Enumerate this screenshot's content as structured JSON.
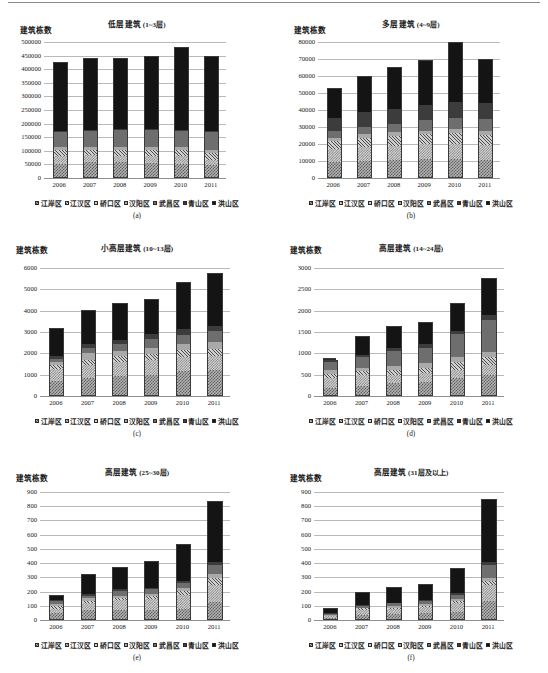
{
  "figure": {
    "y_axis_title": "建筑栋数",
    "districts": [
      "江岸区",
      "江汉区",
      "硚口区",
      "汉阳区",
      "武昌区",
      "青山区",
      "洪山区"
    ],
    "years": [
      "2006",
      "2007",
      "2008",
      "2009",
      "2010",
      "2011"
    ]
  },
  "chart_data": [
    {
      "type": "bar",
      "panel": "a",
      "caption": "(a)",
      "title": "低层建筑",
      "title_range": "(1~3层)",
      "ylabel": "建筑栋数",
      "xlabel": "",
      "ylim": [
        0,
        500000
      ],
      "yticks": [
        0,
        50000,
        100000,
        150000,
        200000,
        250000,
        300000,
        350000,
        400000,
        450000,
        500000
      ],
      "grid": true,
      "legend_position": "bottom",
      "stacked": true,
      "categories": [
        "2006",
        "2007",
        "2008",
        "2009",
        "2010",
        "2011"
      ],
      "series": [
        {
          "name": "江岸区",
          "values": [
            47000,
            56000,
            55000,
            50000,
            48000,
            43000
          ]
        },
        {
          "name": "江汉区",
          "values": [
            29000,
            25000,
            21000,
            28000,
            28000,
            19000
          ]
        },
        {
          "name": "硚口区",
          "values": [
            23000,
            20000,
            24000,
            23000,
            23000,
            27000
          ]
        },
        {
          "name": "汉阳区",
          "values": [
            11000,
            11000,
            11000,
            11000,
            11000,
            11000
          ]
        },
        {
          "name": "武昌区",
          "values": [
            57000,
            57000,
            61000,
            62000,
            60000,
            64000
          ]
        },
        {
          "name": "青山区",
          "values": [
            4000,
            4000,
            4000,
            4000,
            4000,
            4000
          ]
        },
        {
          "name": "洪山区",
          "values": [
            249000,
            262000,
            257000,
            262000,
            301000,
            272000
          ]
        }
      ],
      "totals": [
        420000,
        435000,
        433000,
        440000,
        475000,
        440000
      ]
    },
    {
      "type": "bar",
      "panel": "b",
      "caption": "(b)",
      "title": "多层建筑",
      "title_range": "(4~9层)",
      "ylabel": "建筑栋数",
      "xlabel": "",
      "ylim": [
        0,
        80000
      ],
      "yticks": [
        0,
        10000,
        20000,
        30000,
        40000,
        50000,
        60000,
        70000,
        80000
      ],
      "grid": true,
      "legend_position": "bottom",
      "stacked": true,
      "categories": [
        "2006",
        "2007",
        "2008",
        "2009",
        "2010",
        "2011"
      ],
      "series": [
        {
          "name": "江岸区",
          "values": [
            9000,
            9500,
            10200,
            10500,
            10800,
            10300
          ]
        },
        {
          "name": "江汉区",
          "values": [
            7200,
            8000,
            7800,
            8700,
            9000,
            8300
          ]
        },
        {
          "name": "硚口区",
          "values": [
            4800,
            5700,
            6200,
            5900,
            6400,
            6000
          ]
        },
        {
          "name": "汉阳区",
          "values": [
            2200,
            2200,
            2300,
            2200,
            2400,
            2300
          ]
        },
        {
          "name": "武昌区",
          "values": [
            4000,
            4200,
            4800,
            6100,
            6800,
            7400
          ]
        },
        {
          "name": "青山区",
          "values": [
            7800,
            8400,
            8700,
            8800,
            9100,
            9200
          ]
        },
        {
          "name": "洪山区",
          "values": [
            17000,
            21000,
            24000,
            25800,
            35500,
            25500
          ]
        }
      ],
      "totals": [
        52000,
        59000,
        64000,
        68000,
        72000,
        69000
      ]
    },
    {
      "type": "bar",
      "panel": "c",
      "caption": "(c)",
      "title": "小高层建筑",
      "title_range": "(10~13层)",
      "ylabel": "建筑栋数",
      "xlabel": "",
      "ylim": [
        0,
        6000
      ],
      "yticks": [
        0,
        1000,
        2000,
        3000,
        4000,
        5000,
        6000
      ],
      "grid": true,
      "legend_position": "bottom",
      "stacked": true,
      "categories": [
        "2006",
        "2007",
        "2008",
        "2009",
        "2010",
        "2011"
      ],
      "series": [
        {
          "name": "江岸区",
          "values": [
            640,
            780,
            900,
            940,
            1120,
            1160
          ]
        },
        {
          "name": "江汉区",
          "values": [
            600,
            620,
            640,
            680,
            660,
            670
          ]
        },
        {
          "name": "硚口区",
          "values": [
            180,
            260,
            300,
            300,
            320,
            340
          ]
        },
        {
          "name": "汉阳区",
          "values": [
            110,
            290,
            220,
            280,
            290,
            310
          ]
        },
        {
          "name": "武昌区",
          "values": [
            140,
            250,
            320,
            420,
            440,
            500
          ]
        },
        {
          "name": "青山区",
          "values": [
            180,
            200,
            220,
            230,
            250,
            270
          ]
        },
        {
          "name": "洪山区",
          "values": [
            1230,
            1560,
            1660,
            1620,
            2190,
            2420
          ]
        }
      ],
      "totals": [
        3080,
        3960,
        4260,
        4470,
        5270,
        5670
      ]
    },
    {
      "type": "bar",
      "panel": "d",
      "caption": "(d)",
      "title": "高层建筑",
      "title_range": "(14~24层)",
      "ylabel": "建筑栋数",
      "xlabel": "",
      "ylim": [
        0,
        3000
      ],
      "yticks": [
        0,
        500,
        1000,
        1500,
        2000,
        2500,
        3000
      ],
      "grid": true,
      "legend_position": "bottom",
      "stacked": true,
      "categories": [
        "2006",
        "2007",
        "2008",
        "2009",
        "2010",
        "2011"
      ],
      "series": [
        {
          "name": "江岸区",
          "values": [
            160,
            210,
            290,
            300,
            390,
            480
          ]
        },
        {
          "name": "江汉区",
          "values": [
            230,
            250,
            190,
            210,
            200,
            230
          ]
        },
        {
          "name": "硚口区",
          "values": [
            110,
            100,
            110,
            120,
            190,
            170
          ]
        },
        {
          "name": "汉阳区",
          "values": [
            90,
            80,
            100,
            110,
            120,
            140
          ]
        },
        {
          "name": "武昌区",
          "values": [
            180,
            240,
            350,
            370,
            520,
            740
          ]
        },
        {
          "name": "青山区",
          "values": [
            50,
            60,
            70,
            80,
            90,
            110
          ]
        },
        {
          "name": "洪山区",
          "values": [
            60,
            410,
            490,
            510,
            630,
            850
          ]
        }
      ],
      "totals": [
        880,
        1350,
        1600,
        1700,
        2140,
        2720
      ],
      "notes": "2006年洪山区段为空心(白色)柱段"
    },
    {
      "type": "bar",
      "panel": "e",
      "caption": "(e)",
      "title": "高层建筑",
      "title_range": "(25~30层)",
      "ylabel": "建筑栋数",
      "xlabel": "",
      "ylim": [
        0,
        900
      ],
      "yticks": [
        0,
        100,
        200,
        300,
        400,
        500,
        600,
        700,
        800,
        900
      ],
      "grid": true,
      "legend_position": "bottom",
      "stacked": true,
      "categories": [
        "2006",
        "2007",
        "2008",
        "2009",
        "2010",
        "2011"
      ],
      "series": [
        {
          "name": "江岸区",
          "values": [
            40,
            60,
            60,
            60,
            70,
            120
          ]
        },
        {
          "name": "江汉区",
          "values": [
            30,
            55,
            75,
            80,
            100,
            120
          ]
        },
        {
          "name": "硚口区",
          "values": [
            20,
            15,
            15,
            20,
            30,
            50
          ]
        },
        {
          "name": "汉阳区",
          "values": [
            15,
            15,
            15,
            15,
            15,
            30
          ]
        },
        {
          "name": "武昌区",
          "values": [
            20,
            20,
            35,
            35,
            40,
            60
          ]
        },
        {
          "name": "青山区",
          "values": [
            10,
            10,
            10,
            10,
            10,
            20
          ]
        },
        {
          "name": "洪山区",
          "values": [
            30,
            135,
            150,
            180,
            255,
            420
          ]
        }
      ],
      "totals": [
        165,
        310,
        360,
        400,
        520,
        820
      ]
    },
    {
      "type": "bar",
      "panel": "f",
      "caption": "(f)",
      "title": "高层建筑",
      "title_range": "(31层及以上)",
      "ylabel": "建筑栋数",
      "xlabel": "",
      "ylim": [
        0,
        900
      ],
      "yticks": [
        0,
        100,
        200,
        300,
        400,
        500,
        600,
        700,
        800,
        900
      ],
      "grid": true,
      "legend_position": "bottom",
      "stacked": true,
      "categories": [
        "2006",
        "2007",
        "2008",
        "2009",
        "2010",
        "2011"
      ],
      "series": [
        {
          "name": "江岸区",
          "values": [
            10,
            30,
            35,
            40,
            50,
            130
          ]
        },
        {
          "name": "江汉区",
          "values": [
            8,
            35,
            35,
            45,
            65,
            110
          ]
        },
        {
          "name": "硚口区",
          "values": [
            5,
            10,
            10,
            10,
            15,
            30
          ]
        },
        {
          "name": "汉阳区",
          "values": [
            5,
            5,
            10,
            10,
            10,
            20
          ]
        },
        {
          "name": "武昌区",
          "values": [
            10,
            15,
            20,
            25,
            30,
            90
          ]
        },
        {
          "name": "青山区",
          "values": [
            5,
            5,
            5,
            5,
            10,
            20
          ]
        },
        {
          "name": "洪山区",
          "values": [
            27,
            80,
            100,
            105,
            170,
            440
          ]
        }
      ],
      "totals": [
        70,
        180,
        215,
        240,
        350,
        840
      ]
    }
  ]
}
